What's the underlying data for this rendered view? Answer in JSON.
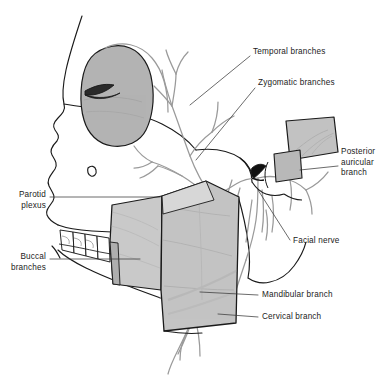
{
  "figure": {
    "colors": {
      "background": "#ffffff",
      "outline": "#1a1a1a",
      "nerve": "#9a9a9a",
      "muscle_fill": "#c6c6c6",
      "muscle_fill_light": "#dcdcdc",
      "orbit_fill": "#b3b3b3",
      "ear_fill": "#c2c2c2",
      "label_text": "#1b1b1b",
      "leader_line": "#3a3a3a"
    }
  },
  "labels": [
    {
      "id": "temporal-branches",
      "text": "Temporal branches",
      "align": "left",
      "x": 253,
      "y": 52
    },
    {
      "id": "zygomatic-branches",
      "text": "Zygomatic branches",
      "align": "left",
      "x": 258,
      "y": 83
    },
    {
      "id": "posterior-auricular-branch",
      "line1": "Posterior",
      "line2": "auricular",
      "line3": "branch",
      "text": "Posterior\nauricular\nbranch",
      "align": "left",
      "x": 342,
      "y": 152
    },
    {
      "id": "parotid-plexus",
      "line1": "Parotid",
      "line2": "plexus",
      "text": "Parotid\nplexus",
      "align": "right",
      "x": 12,
      "y": 191
    },
    {
      "id": "buccal-branches",
      "line1": "Buccal",
      "line2": "branches",
      "text": "Buccal\nbranches",
      "align": "right",
      "x": 10,
      "y": 252
    },
    {
      "id": "facial-nerve",
      "text": "Facial nerve",
      "align": "left",
      "x": 292,
      "y": 240
    },
    {
      "id": "mandibular-branch",
      "text": "Mandibular branch",
      "align": "left",
      "x": 261,
      "y": 291
    },
    {
      "id": "cervical-branch",
      "text": "Cervical branch",
      "align": "left",
      "x": 261,
      "y": 313
    }
  ],
  "structures": [
    {
      "id": "skull-profile",
      "name": "skull-profile-outline"
    },
    {
      "id": "orbit",
      "name": "orbital-region"
    },
    {
      "id": "eye-slit",
      "name": "eye-slit"
    },
    {
      "id": "teeth",
      "name": "upper-and-lower-teeth"
    },
    {
      "id": "masseter",
      "name": "masseter-muscle-block"
    },
    {
      "id": "parotid-gland",
      "name": "parotid-gland-block"
    },
    {
      "id": "ear-flap",
      "name": "reflected-auricle-flap"
    },
    {
      "id": "stylomastoid",
      "name": "stylomastoid-foramen-marker"
    },
    {
      "id": "nerve-tree",
      "name": "facial-nerve-branch-tree"
    },
    {
      "id": "mandible",
      "name": "mandible-ramus"
    }
  ]
}
